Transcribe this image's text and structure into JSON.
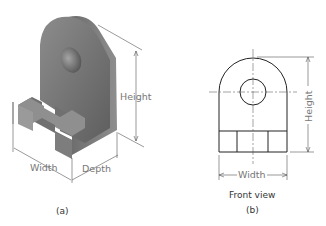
{
  "figure_a": {
    "caption": "(a)",
    "dimensions": {
      "height": "Height",
      "width": "Width",
      "depth": "Depth"
    }
  },
  "figure_b": {
    "title": "Front view",
    "caption": "(b)",
    "dimensions": {
      "height": "Height",
      "width": "Width"
    }
  },
  "colors": {
    "solid_face": "#6e6e6e",
    "solid_side": "#8a8a8a",
    "dim_line": "#555555",
    "outline": "#222222"
  }
}
